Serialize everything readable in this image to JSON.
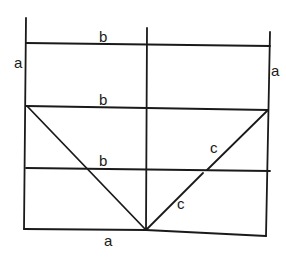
{
  "diagram": {
    "type": "line-drawing",
    "stroke_color": "#1a1a1a",
    "background_color": "#ffffff",
    "labels": {
      "a_left": "a",
      "a_right": "a",
      "a_bottom": "a",
      "b_top": "b",
      "b_middle": "b",
      "b_lower": "b",
      "c_upper": "c",
      "c_lower": "c"
    },
    "lines": [
      {
        "id": "left-vertical",
        "x1": 26,
        "y1": 18,
        "x2": 24,
        "y2": 229
      },
      {
        "id": "center-vertical",
        "x1": 147,
        "y1": 28,
        "x2": 146,
        "y2": 230
      },
      {
        "id": "right-vertical",
        "x1": 270,
        "y1": 32,
        "x2": 266,
        "y2": 236
      },
      {
        "id": "top-b-line",
        "x1": 26,
        "y1": 43,
        "x2": 270,
        "y2": 46
      },
      {
        "id": "middle-b-line",
        "x1": 26,
        "y1": 106,
        "x2": 268,
        "y2": 110
      },
      {
        "id": "lower-b-line",
        "x1": 26,
        "y1": 168,
        "x2": 270,
        "y2": 171
      },
      {
        "id": "bottom-line-left",
        "x1": 24,
        "y1": 229,
        "x2": 146,
        "y2": 230
      },
      {
        "id": "bottom-line-right",
        "x1": 146,
        "y1": 230,
        "x2": 266,
        "y2": 236
      },
      {
        "id": "left-diagonal",
        "x1": 27,
        "y1": 106,
        "x2": 146,
        "y2": 230
      },
      {
        "id": "right-diagonal",
        "x1": 268,
        "y1": 110,
        "x2": 146,
        "y2": 230
      }
    ]
  }
}
